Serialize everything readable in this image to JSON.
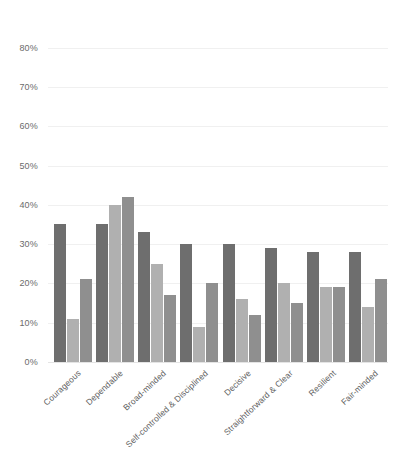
{
  "chart_data": {
    "type": "bar",
    "title": "",
    "subtitle": "",
    "xlabel": "",
    "ylabel": "",
    "ylim": [
      0,
      85
    ],
    "grid": true,
    "legend_position": "none",
    "y_ticks": [
      "0%",
      "10%",
      "20%",
      "30%",
      "40%",
      "50%",
      "60%",
      "70%",
      "80%"
    ],
    "y_tick_values": [
      0,
      10,
      20,
      30,
      40,
      50,
      60,
      70,
      80
    ],
    "categories": [
      "Courageous",
      "Dependable",
      "Broad-minded",
      "Self-controlled & Disciplined",
      "Decisive",
      "Straightforward & Clear",
      "Resilient",
      "Fair-minded"
    ],
    "series": [
      {
        "name": "Series 1",
        "color": "#6e6e6e",
        "values": [
          35,
          35,
          33,
          30,
          30,
          29,
          28,
          28
        ]
      },
      {
        "name": "Series 2",
        "color": "#b0b0b0",
        "values": [
          11,
          40,
          25,
          9,
          16,
          20,
          19,
          14
        ]
      },
      {
        "name": "Series 3",
        "color": "#8f8f8f",
        "values": [
          21,
          42,
          17,
          20,
          12,
          15,
          19,
          21
        ]
      }
    ],
    "colors": {
      "series_1": "#6e6e6e",
      "series_2": "#b0b0b0",
      "series_3": "#8f8f8f",
      "gridline": "#f0f0f0",
      "axis_text": "#6b6b6b",
      "label_text": "#5e5e5e",
      "background": "#ffffff"
    }
  }
}
